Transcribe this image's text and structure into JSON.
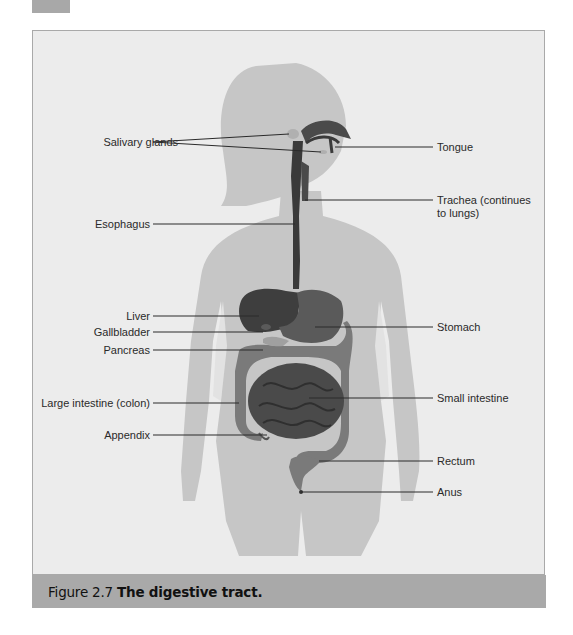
{
  "figure": {
    "number": "Figure 2.7",
    "title": "The digestive tract.",
    "labels_left": [
      {
        "id": "salivary-glands",
        "text": "Salivary glands",
        "x": 135,
        "y": 136
      },
      {
        "id": "esophagus",
        "text": "Esophagus",
        "x": 135,
        "y": 218
      },
      {
        "id": "liver",
        "text": "Liver",
        "x": 135,
        "y": 310
      },
      {
        "id": "gallbladder",
        "text": "Gallbladder",
        "x": 135,
        "y": 326
      },
      {
        "id": "pancreas",
        "text": "Pancreas",
        "x": 135,
        "y": 344
      },
      {
        "id": "large-intestine",
        "text": "Large intestine (colon)",
        "x": 135,
        "y": 397
      },
      {
        "id": "appendix",
        "text": "Appendix",
        "x": 135,
        "y": 429
      }
    ],
    "labels_right": [
      {
        "id": "tongue",
        "text": "Tongue",
        "x": 438,
        "y": 141
      },
      {
        "id": "trachea",
        "text": "Trachea (continues to lungs)",
        "x": 438,
        "y": 194
      },
      {
        "id": "stomach",
        "text": "Stomach",
        "x": 438,
        "y": 321
      },
      {
        "id": "small-intestine",
        "text": "Small intestine",
        "x": 438,
        "y": 392
      },
      {
        "id": "rectum",
        "text": "Rectum",
        "x": 438,
        "y": 455
      },
      {
        "id": "anus",
        "text": "Anus",
        "x": 438,
        "y": 486
      }
    ],
    "colors": {
      "background": "#ececec",
      "silhouette": "#c4c4c4",
      "organs_dark": "#3a3a3a",
      "organs_mid": "#6a6a6a",
      "caption_band": "#a9a9a9"
    }
  }
}
